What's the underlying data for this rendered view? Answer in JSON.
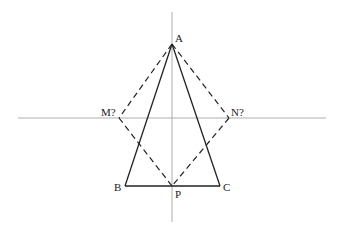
{
  "diagram": {
    "axes": {
      "vertical": {
        "x": 172,
        "y1": 12,
        "y2": 222
      },
      "horizontal": {
        "y": 118,
        "x1": 18,
        "x2": 326
      },
      "color": "#9a9a9a"
    },
    "points": {
      "A": {
        "label": "A",
        "x": 172,
        "y": 44
      },
      "B": {
        "label": "B",
        "x": 125,
        "y": 186
      },
      "C": {
        "label": "C",
        "x": 220,
        "y": 186
      },
      "P": {
        "label": "P",
        "x": 172,
        "y": 186
      },
      "M": {
        "label": "M?",
        "x": 119,
        "y": 118
      },
      "N": {
        "label": "N?",
        "x": 229,
        "y": 118
      }
    },
    "solid_segments": [
      "AB",
      "AC",
      "BC"
    ],
    "dashed_segments": [
      "AM",
      "AN",
      "MP",
      "NP"
    ],
    "line_color": "#222222"
  }
}
